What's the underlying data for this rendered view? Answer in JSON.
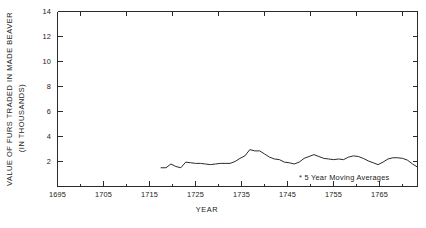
{
  "chart_data": {
    "type": "line",
    "title": "",
    "xlabel": "YEAR",
    "ylabel": "VALUE OF FURS TRADED IN MADE BEAVER (IN THOUSANDS)",
    "ylabel_line1": "VALUE OF FURS TRADED IN MADE BEAVER",
    "ylabel_line2": "(IN THOUSANDS)",
    "xlim": [
      1695,
      1768
    ],
    "ylim": [
      0,
      14
    ],
    "grid": false,
    "legend": "none",
    "annotation": "* 5 Year Moving Averages",
    "y_ticks": [
      2,
      4,
      6,
      8,
      10,
      12,
      14
    ],
    "y_tick_labels": [
      "2",
      "4",
      "6",
      "8",
      "10",
      "12",
      "14"
    ],
    "x_ticks_major": [
      1695,
      1705,
      1715,
      1725,
      1735,
      1745,
      1755,
      1765
    ],
    "x_tick_labels": [
      "1695",
      "1705",
      "1715",
      "1725",
      "1735",
      "1745",
      "1755",
      "1765"
    ],
    "x_ticks_minor": [
      1700,
      1710,
      1720,
      1730,
      1740,
      1750,
      1760
    ],
    "series": [
      {
        "name": "Value of furs traded (5 year moving average)",
        "color": "#2b2b2b",
        "x": [
          1716,
          1717,
          1718,
          1719,
          1720,
          1721,
          1722,
          1723,
          1724,
          1725,
          1726,
          1727,
          1728,
          1729,
          1730,
          1731,
          1732,
          1733,
          1734,
          1735,
          1736,
          1737,
          1738,
          1739,
          1740,
          1741,
          1742,
          1743,
          1744,
          1745,
          1746,
          1747,
          1748,
          1749,
          1750,
          1751,
          1752,
          1753,
          1754,
          1755,
          1756,
          1757,
          1758,
          1759,
          1760,
          1761,
          1762,
          1763,
          1764,
          1765,
          1766,
          1767,
          1768
        ],
        "y": [
          1.5,
          1.5,
          1.8,
          1.6,
          1.5,
          1.95,
          1.9,
          1.85,
          1.85,
          1.8,
          1.75,
          1.8,
          1.85,
          1.85,
          1.85,
          2.0,
          2.25,
          2.45,
          2.95,
          2.85,
          2.85,
          2.6,
          2.35,
          2.2,
          2.15,
          1.95,
          1.9,
          1.8,
          1.95,
          2.25,
          2.4,
          2.55,
          2.4,
          2.25,
          2.2,
          2.15,
          2.2,
          2.15,
          2.35,
          2.45,
          2.4,
          2.25,
          2.05,
          1.9,
          1.75,
          1.95,
          2.2,
          2.3,
          2.3,
          2.25,
          2.1,
          1.8,
          1.55
        ]
      }
    ]
  },
  "axes": {
    "y_axis_name": "value-axis",
    "x_axis_name": "year-axis"
  }
}
